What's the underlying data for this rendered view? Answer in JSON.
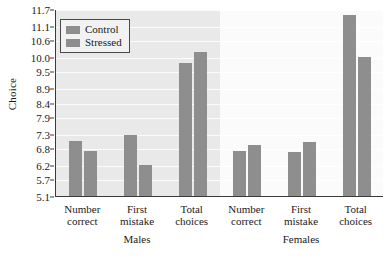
{
  "chart_data": {
    "type": "bar",
    "title": "",
    "xlabel": "",
    "ylabel": "Choice",
    "ylim": [
      5.1,
      11.7
    ],
    "grid": true,
    "legend_position": "top-left",
    "yticks": [
      "11.7",
      "11.1",
      "10.6",
      "10.0",
      "9.5",
      "8.9",
      "8.4",
      "7.9",
      "7.3",
      "6.8",
      "6.2",
      "5.7",
      "5.1"
    ],
    "ytick_values": [
      11.7,
      11.1,
      10.6,
      10.0,
      9.5,
      8.9,
      8.4,
      7.9,
      7.3,
      6.8,
      6.2,
      5.7,
      5.1
    ],
    "legend": [
      "Control",
      "Stressed"
    ],
    "panels": [
      {
        "name": "Males",
        "categories": [
          "Number correct",
          "First mistake",
          "Total choices"
        ],
        "category_lines": [
          [
            "Number",
            "correct"
          ],
          [
            "First",
            "mistake"
          ],
          [
            "Total",
            "choices"
          ]
        ],
        "series": [
          {
            "name": "Control",
            "values": [
              7.05,
              7.25,
              9.8
            ]
          },
          {
            "name": "Stressed",
            "values": [
              6.7,
              6.2,
              10.2
            ]
          }
        ]
      },
      {
        "name": "Females",
        "categories": [
          "Number correct",
          "First mistake",
          "Total choices"
        ],
        "category_lines": [
          [
            "Number",
            "correct"
          ],
          [
            "First",
            "mistake"
          ],
          [
            "Total",
            "choices"
          ]
        ],
        "series": [
          {
            "name": "Control",
            "values": [
              6.7,
              6.65,
              11.5
            ]
          },
          {
            "name": "Stressed",
            "values": [
              6.9,
              7.0,
              10.0
            ]
          }
        ]
      }
    ],
    "colors": {
      "bar": "#8e8e8e",
      "panel_left_bg": "#e9e9e9",
      "panel_right_bg": "#fbfbfb",
      "axis": "#3a3a3a",
      "gridline": "#ffffff",
      "legend_bg": "#f2f2f2"
    }
  }
}
